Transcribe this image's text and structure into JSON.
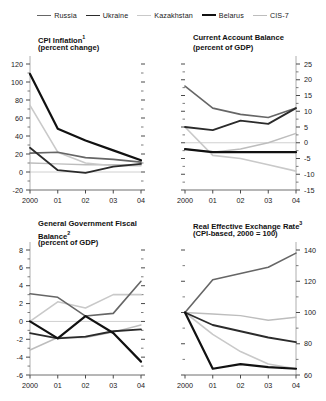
{
  "legend": {
    "items": [
      {
        "label": "Russia",
        "color": "#666666",
        "width": 1.6
      },
      {
        "label": "Ukraine",
        "color": "#2b2b2b",
        "width": 1.8
      },
      {
        "label": "Kazakhstan",
        "color": "#c9c9c9",
        "width": 1.6
      },
      {
        "label": "Belarus",
        "color": "#111111",
        "width": 2.2
      },
      {
        "label": "CIS-7",
        "color": "#bdbdbd",
        "width": 1.4
      }
    ]
  },
  "series_order": [
    "Russia",
    "Ukraine",
    "Kazakhstan",
    "Belarus",
    "CIS-7"
  ],
  "chart_data": [
    {
      "id": "cpi-inflation",
      "type": "line",
      "title": "CPI Inflation",
      "title_superscript": "1",
      "subtitle": "(percent change)",
      "axis_side": "left",
      "x": [
        "2000",
        "01",
        "02",
        "03",
        "04"
      ],
      "xlabel": "",
      "ylabel": "",
      "ylim": [
        -20,
        120
      ],
      "yticks": [
        -20,
        0,
        20,
        40,
        60,
        80,
        100,
        120
      ],
      "ytick_labels": [
        "-20",
        "0",
        "20",
        "40",
        "60",
        "80",
        "100",
        "120"
      ],
      "minor_ticks": true,
      "grid": false,
      "series": [
        {
          "name": "Russia",
          "values": [
            21,
            22,
            16,
            14,
            11
          ]
        },
        {
          "name": "Ukraine",
          "values": [
            27,
            2,
            -1,
            6,
            9
          ]
        },
        {
          "name": "Kazakhstan",
          "values": [
            74,
            22,
            10,
            7,
            7
          ]
        },
        {
          "name": "Belarus",
          "values": [
            109,
            48,
            35,
            24,
            13
          ]
        },
        {
          "name": "CIS-7",
          "values": [
            10,
            9,
            8,
            8,
            8
          ]
        }
      ]
    },
    {
      "id": "current-account-balance",
      "type": "line",
      "title": "Current Account Balance",
      "title_superscript": "",
      "subtitle": "(percent of GDP)",
      "axis_side": "right",
      "x": [
        "2000",
        "01",
        "02",
        "03",
        "04"
      ],
      "xlabel": "",
      "ylabel": "",
      "ylim": [
        -15,
        25
      ],
      "yticks": [
        -15,
        -10,
        -5,
        0,
        5,
        10,
        15,
        20,
        25
      ],
      "ytick_labels": [
        "-15",
        "-10",
        "-5",
        "0",
        "5",
        "10",
        "15",
        "20",
        "25"
      ],
      "minor_ticks": true,
      "grid": false,
      "series": [
        {
          "name": "Russia",
          "values": [
            18,
            11,
            9,
            8,
            11
          ]
        },
        {
          "name": "Ukraine",
          "values": [
            5,
            4,
            7,
            6,
            11
          ]
        },
        {
          "name": "Kazakhstan",
          "values": [
            5,
            -4,
            -5,
            -7,
            -9
          ]
        },
        {
          "name": "Belarus",
          "values": [
            -2,
            -3,
            -3,
            -3,
            -3
          ]
        },
        {
          "name": "CIS-7",
          "values": [
            -2,
            -3,
            -2,
            0,
            3
          ]
        }
      ]
    },
    {
      "id": "fiscal-balance",
      "type": "line",
      "title": "General Government Fiscal",
      "title_line2": "Balance",
      "title_superscript": "2",
      "subtitle": "(percent of GDP)",
      "axis_side": "left",
      "x": [
        "2000",
        "01",
        "02",
        "03",
        "04"
      ],
      "xlabel": "",
      "ylabel": "",
      "ylim": [
        -6,
        8
      ],
      "yticks": [
        -6,
        -4,
        -2,
        0,
        2,
        4,
        6,
        8
      ],
      "ytick_labels": [
        "-6",
        "-4",
        "-2",
        "0",
        "2",
        "4",
        "6",
        "8"
      ],
      "minor_ticks": true,
      "grid": false,
      "series": [
        {
          "name": "Russia",
          "values": [
            3.1,
            2.7,
            0.6,
            0.9,
            4.5
          ]
        },
        {
          "name": "Ukraine",
          "values": [
            -1.3,
            -1.9,
            -1.7,
            -1.1,
            -0.9
          ]
        },
        {
          "name": "Kazakhstan",
          "values": [
            0.0,
            2.2,
            1.5,
            3.0,
            3.0
          ]
        },
        {
          "name": "Belarus",
          "values": [
            0.0,
            -1.9,
            0.6,
            -1.3,
            -4.5
          ]
        },
        {
          "name": "CIS-7",
          "values": [
            -3.2,
            -1.8,
            -1.8,
            -1.2,
            -0.4
          ]
        }
      ]
    },
    {
      "id": "real-effective-exchange-rate",
      "type": "line",
      "title": "Real Effective Exchange Rate",
      "title_superscript": "3",
      "subtitle": "(CPI-based, 2000 = 100)",
      "axis_side": "right",
      "x": [
        "2000",
        "01",
        "02",
        "03",
        "04"
      ],
      "xlabel": "",
      "ylabel": "",
      "ylim": [
        60,
        140
      ],
      "yticks": [
        60,
        80,
        100,
        120,
        140
      ],
      "ytick_labels": [
        "60",
        "80",
        "100",
        "120",
        "140"
      ],
      "minor_ticks": true,
      "grid": false,
      "series": [
        {
          "name": "Russia",
          "values": [
            100,
            121,
            125,
            129,
            138
          ]
        },
        {
          "name": "Ukraine",
          "values": [
            100,
            92,
            88,
            84,
            81
          ]
        },
        {
          "name": "Kazakhstan",
          "values": [
            100,
            86,
            75,
            67,
            64
          ]
        },
        {
          "name": "Belarus",
          "values": [
            100,
            64,
            67,
            65,
            64
          ]
        },
        {
          "name": "CIS-7",
          "values": [
            100,
            99,
            98,
            95,
            97
          ]
        }
      ]
    }
  ]
}
